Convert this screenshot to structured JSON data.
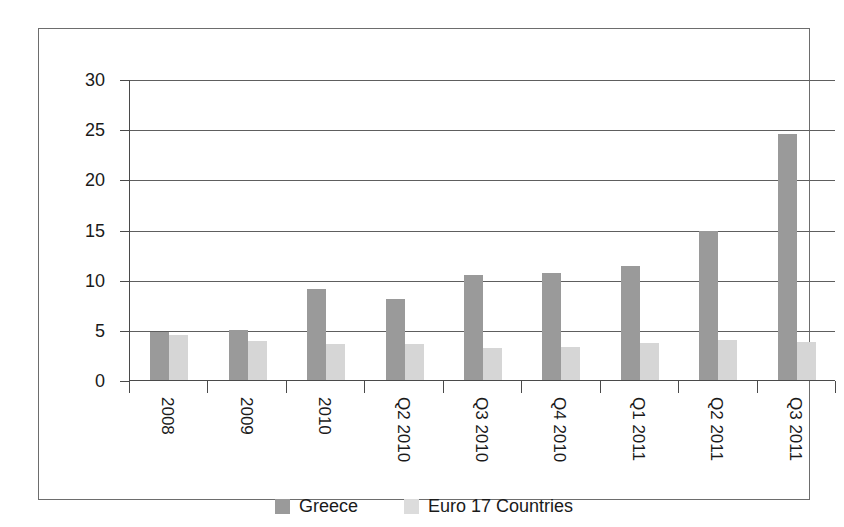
{
  "chart_data": {
    "type": "bar",
    "title": "",
    "subtitle": "",
    "xlabel": "",
    "ylabel": "",
    "ylim": [
      0,
      30
    ],
    "yticks": [
      0,
      5,
      10,
      15,
      20,
      25,
      30
    ],
    "grid": true,
    "legend_position": "bottom",
    "categories": [
      "2008",
      "2009",
      "2010",
      "Q2 2010",
      "Q3 2010",
      "Q4 2010",
      "Q1 2011",
      "Q2 2011",
      "Q3 2011"
    ],
    "series": [
      {
        "name": "Greece",
        "color": "#9a9a9a",
        "values": [
          4.8,
          5.0,
          9.1,
          8.1,
          10.5,
          10.7,
          11.4,
          14.9,
          24.5
        ]
      },
      {
        "name": "Euro 17 Countries",
        "color": "#d6d6d6",
        "values": [
          4.5,
          3.9,
          3.6,
          3.6,
          3.2,
          3.3,
          3.7,
          4.0,
          3.8
        ]
      }
    ]
  },
  "legend": {
    "items": [
      {
        "label": "Greece",
        "swatch": "greece"
      },
      {
        "label": "Euro 17 Countries",
        "swatch": "euro"
      }
    ]
  }
}
